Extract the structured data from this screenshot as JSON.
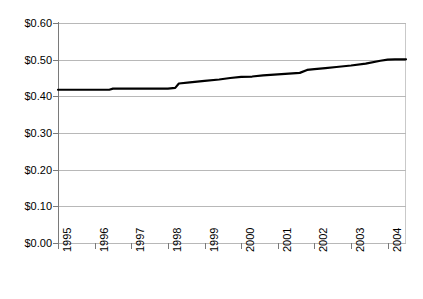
{
  "chart": {
    "title": "",
    "background_color": "#ffffff",
    "gridline_color": "#b8b8b8",
    "axis_color": "#7a7a7a",
    "series_color": "#000000"
  },
  "chart_data": {
    "type": "line",
    "title": "",
    "xlabel": "",
    "ylabel": "",
    "ylim": [
      0.0,
      0.6
    ],
    "xlim": [
      1995.0,
      2004.5
    ],
    "grid": true,
    "legend": false,
    "y_tick_labels": [
      "$0.60",
      "$0.50",
      "$0.40",
      "$0.30",
      "$0.20",
      "$0.10",
      "$0.00"
    ],
    "y_tick_values": [
      0.6,
      0.5,
      0.4,
      0.3,
      0.2,
      0.1,
      0.0
    ],
    "x_tick_labels": [
      "1995",
      "1996",
      "1997",
      "1998",
      "1999",
      "2000",
      "2001",
      "2002",
      "2003",
      "2004"
    ],
    "x_tick_values": [
      1995,
      1996,
      1997,
      1998,
      1999,
      2000,
      2001,
      2002,
      2003,
      2004
    ],
    "series": [
      {
        "name": "Price",
        "x": [
          1995.0,
          1995.5,
          1996.0,
          1996.4,
          1996.5,
          1997.0,
          1997.5,
          1998.0,
          1998.2,
          1998.3,
          1998.6,
          1999.0,
          1999.4,
          1999.7,
          2000.0,
          2000.3,
          2000.6,
          2001.0,
          2001.3,
          2001.6,
          2001.8,
          2002.0,
          2002.3,
          2002.6,
          2003.0,
          2003.4,
          2003.8,
          2004.0,
          2004.2,
          2004.5
        ],
        "values": [
          0.418,
          0.418,
          0.418,
          0.418,
          0.421,
          0.421,
          0.421,
          0.421,
          0.423,
          0.435,
          0.438,
          0.442,
          0.446,
          0.45,
          0.453,
          0.454,
          0.457,
          0.46,
          0.462,
          0.464,
          0.472,
          0.474,
          0.477,
          0.48,
          0.484,
          0.489,
          0.497,
          0.5,
          0.501,
          0.501
        ]
      }
    ]
  }
}
